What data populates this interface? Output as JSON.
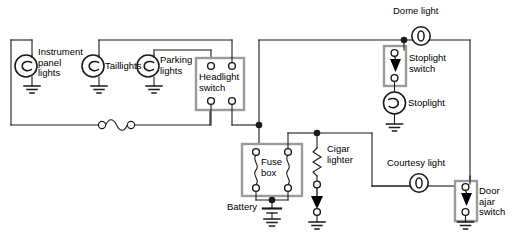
{
  "diagram": {
    "type": "electrical-circuit-schematic",
    "background_color": "#ffffff",
    "wire_color": "#1a1a1a",
    "box_outline_color": "#9a9a9a",
    "labels": {
      "instrument_panel_lights": "Instrument\npanel\nlights",
      "taillights": "Taillights",
      "parking_lights": "Parking\nlights",
      "headlight_switch": "Headlight\nswitch",
      "dome_light": "Dome light",
      "stoplight_switch": "Stoplight\nswitch",
      "stoplight": "Stoplight",
      "courtesy_light": "Courtesy light",
      "door_ajar_switch": "Door\najar\nswitch",
      "fuse_box": "Fuse\nbox",
      "battery": "Battery",
      "cigar_lighter": "Cigar\nlighter"
    },
    "components": [
      {
        "id": "instrument-panel-lights",
        "kind": "lamp",
        "label": "Instrument panel lights"
      },
      {
        "id": "taillights",
        "kind": "lamp",
        "label": "Taillights"
      },
      {
        "id": "parking-lights",
        "kind": "lamp",
        "label": "Parking lights"
      },
      {
        "id": "headlight-switch",
        "kind": "switch-box-4-terminal",
        "label": "Headlight switch"
      },
      {
        "id": "inline-fuse",
        "kind": "fuse",
        "label": ""
      },
      {
        "id": "fuse-box",
        "kind": "fuse-box-2-fuse",
        "label": "Fuse box"
      },
      {
        "id": "battery",
        "kind": "battery-ground",
        "label": "Battery"
      },
      {
        "id": "cigar-lighter",
        "kind": "resistor-switch",
        "label": "Cigar lighter"
      },
      {
        "id": "dome-light",
        "kind": "dome-lamp",
        "label": "Dome light"
      },
      {
        "id": "stoplight-switch",
        "kind": "switch-box-arrow",
        "label": "Stoplight switch"
      },
      {
        "id": "stoplight",
        "kind": "lamp",
        "label": "Stoplight"
      },
      {
        "id": "courtesy-light",
        "kind": "dome-lamp",
        "label": "Courtesy light"
      },
      {
        "id": "door-ajar-switch",
        "kind": "switch-box-arrow",
        "label": "Door ajar switch"
      }
    ]
  }
}
